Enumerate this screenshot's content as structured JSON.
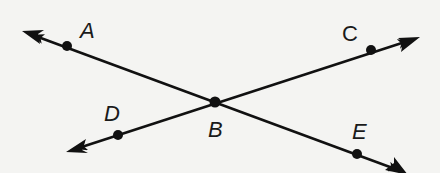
{
  "diagram": {
    "type": "intersecting-lines",
    "background": "#f4f4f2",
    "stroke_color": "#111111",
    "points": [
      {
        "label": "A",
        "x": 67,
        "y": 46,
        "label_x": 80,
        "label_y": 38
      },
      {
        "label": "B",
        "x": 215,
        "y": 102,
        "label_x": 208,
        "label_y": 137
      },
      {
        "label": "C",
        "x": 371,
        "y": 50,
        "label_x": 342,
        "label_y": 41
      },
      {
        "label": "D",
        "x": 118,
        "y": 135,
        "label_x": 104,
        "label_y": 121
      },
      {
        "label": "E",
        "x": 357,
        "y": 154,
        "label_x": 352,
        "label_y": 139
      }
    ],
    "lines": [
      {
        "name": "line-AE",
        "through": [
          "A",
          "B",
          "E"
        ],
        "from": [
          22,
          31
        ],
        "to": [
          410,
          175
        ]
      },
      {
        "name": "line-DC",
        "through": [
          "D",
          "B",
          "C"
        ],
        "from": [
          66,
          152
        ],
        "to": [
          420,
          37
        ]
      }
    ],
    "labels": {
      "A": "A",
      "B": "B",
      "C": "C",
      "D": "D",
      "E": "E"
    }
  }
}
